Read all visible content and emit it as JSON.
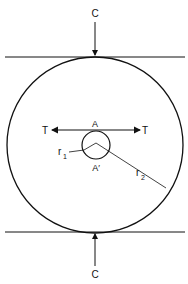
{
  "labels": {
    "top_force": "C",
    "bottom_force": "C",
    "left_tension": "T",
    "right_tension": "T",
    "point_top": "A",
    "point_bottom": "A′",
    "inner_radius": "r",
    "inner_radius_sub": "1",
    "outer_radius": "r",
    "outer_radius_sub": "2"
  },
  "colors": {
    "stroke": "#111111",
    "background": "#ffffff"
  }
}
